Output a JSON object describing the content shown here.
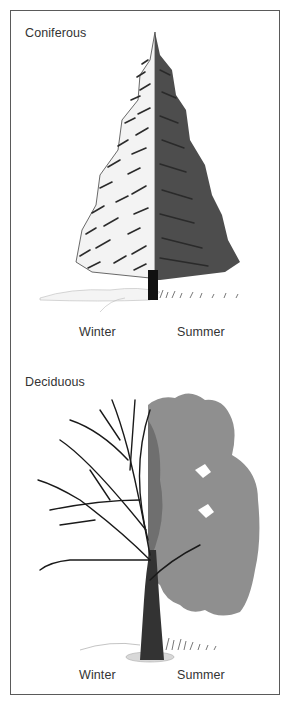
{
  "figure": {
    "sections": [
      {
        "title": "Coniferous",
        "captions": {
          "left": "Winter",
          "right": "Summer"
        }
      },
      {
        "title": "Deciduous",
        "captions": {
          "left": "Winter",
          "right": "Summer"
        }
      }
    ],
    "colors": {
      "border": "#5a5a5a",
      "snow": "#f2f2f2",
      "conifer_dark": "#3a3a3a",
      "conifer_mid": "#5e5e5e",
      "foliage": "#8c8c8c",
      "foliage_dark": "#6f6f6f",
      "branch": "#1a1a1a"
    }
  }
}
